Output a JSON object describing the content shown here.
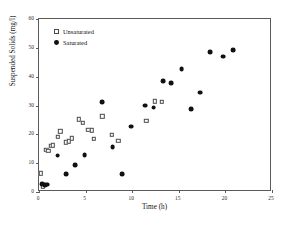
{
  "chart_data": {
    "type": "scatter",
    "title": "",
    "xlabel": "Time (h)",
    "ylabel": "Suspended Solids (mg/l)",
    "xlim": [
      0,
      25
    ],
    "ylim": [
      0,
      60
    ],
    "xticks": [
      0,
      5,
      10,
      15,
      20,
      25
    ],
    "yticks": [
      0,
      10,
      20,
      30,
      40,
      50,
      60
    ],
    "grid": false,
    "legend_position": "top-left",
    "series": [
      {
        "name": "Unsaturated",
        "marker": "open-square",
        "color": "#4a4a4a",
        "points": [
          [
            0.3,
            6.2
          ],
          [
            0.5,
            1.6
          ],
          [
            0.9,
            14.3
          ],
          [
            1.1,
            14.0
          ],
          [
            1.4,
            15.6
          ],
          [
            1.6,
            15.9
          ],
          [
            2.1,
            18.8
          ],
          [
            2.4,
            20.7
          ],
          [
            3.0,
            16.9
          ],
          [
            3.3,
            17.2
          ],
          [
            3.6,
            18.3
          ],
          [
            4.4,
            24.8
          ],
          [
            4.8,
            23.6
          ],
          [
            5.4,
            21.3
          ],
          [
            5.8,
            21.1
          ],
          [
            6.0,
            18.1
          ],
          [
            6.9,
            25.9
          ],
          [
            7.9,
            19.5
          ],
          [
            8.6,
            17.5
          ],
          [
            11.6,
            24.3
          ],
          [
            12.5,
            31.1
          ],
          [
            13.3,
            31.0
          ]
        ]
      },
      {
        "name": "Saturated",
        "marker": "filled-circle",
        "color": "#111111",
        "points": [
          [
            0.4,
            2.4
          ],
          [
            0.6,
            2.2
          ],
          [
            0.8,
            2.1
          ],
          [
            1.0,
            2.2
          ],
          [
            2.1,
            12.3
          ],
          [
            3.0,
            5.8
          ],
          [
            4.0,
            8.9
          ],
          [
            5.0,
            12.4
          ],
          [
            6.9,
            30.7
          ],
          [
            8.0,
            15.3
          ],
          [
            9.0,
            5.9
          ],
          [
            10.0,
            22.3
          ],
          [
            11.5,
            29.6
          ],
          [
            12.4,
            28.9
          ],
          [
            13.4,
            38.0
          ],
          [
            14.3,
            37.4
          ],
          [
            15.4,
            42.4
          ],
          [
            16.4,
            28.3
          ],
          [
            17.4,
            34.1
          ],
          [
            18.5,
            48.2
          ],
          [
            19.9,
            46.6
          ],
          [
            20.9,
            48.8
          ]
        ]
      }
    ]
  },
  "axes": {
    "x_title": "Time (h)",
    "y_title": "Suspended Solids (mg/l)",
    "x_tick_labels": [
      "0",
      "5",
      "10",
      "15",
      "20",
      "25"
    ],
    "y_tick_labels": [
      "0",
      "10",
      "20",
      "30",
      "40",
      "50",
      "60"
    ]
  },
  "legend": {
    "entries": [
      {
        "label": "Unsaturated",
        "marker": "open-square"
      },
      {
        "label": "Saturated",
        "marker": "filled-circle"
      }
    ]
  }
}
